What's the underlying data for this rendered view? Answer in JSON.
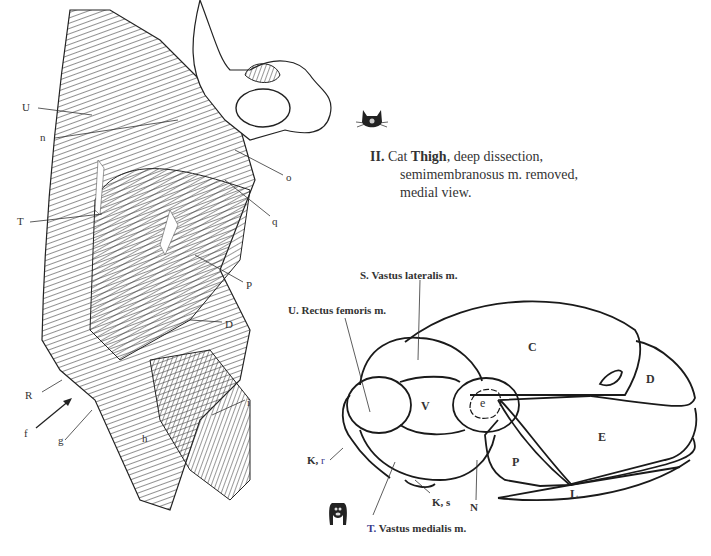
{
  "caption": {
    "number": "II.",
    "animal": "Cat",
    "part": "Thigh",
    "line1_rest": ", deep dissection,",
    "line2": "semimembranosus m. removed,",
    "line3": "medial view."
  },
  "icons": {
    "cat": "cat-head-icon",
    "dog": "dog-head-icon"
  },
  "left_labels": {
    "U": "U",
    "n": "n",
    "T": "T",
    "o": "o",
    "q": "q",
    "P": "P",
    "D": "D",
    "R": "R",
    "f": "f",
    "g": "g",
    "h": "h",
    "i": "i"
  },
  "cross_section": {
    "title_S": "S. Vastus lateralis m.",
    "title_U": "U. Rectus femoris m.",
    "title_T_prefix": "T.",
    "title_T": " Vastus medialis m.",
    "K_r_prefix": "K,",
    "K_r_suffix": " r",
    "K_s": "K, s",
    "N": "N",
    "segments": {
      "C": "C",
      "D": "D",
      "E": "E",
      "P": "P",
      "L": "L",
      "V": "V",
      "e": "e"
    }
  }
}
